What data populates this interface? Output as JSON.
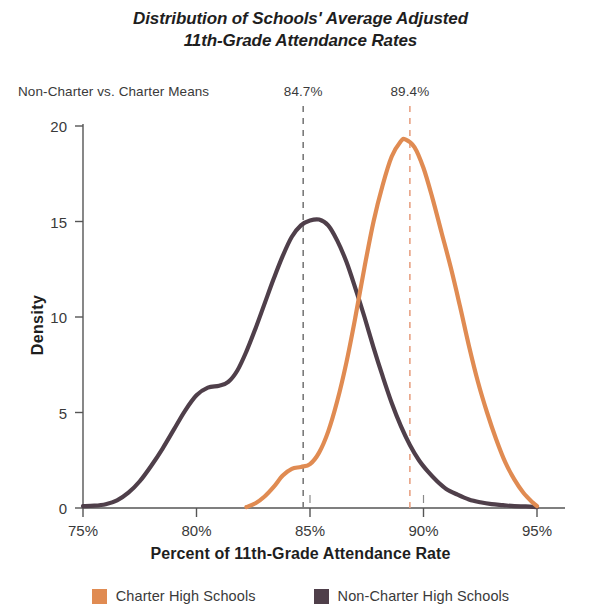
{
  "chart_data": {
    "type": "line",
    "title": "Distribution of Schools' Average Adjusted 11th-Grade Attendance Rates",
    "title_lines": [
      "Distribution of Schools' Average Adjusted",
      "11th-Grade Attendance Rates"
    ],
    "subtitle": "Non-Charter vs. Charter Means",
    "xlabel": "Percent of 11th-Grade Attendance Rate",
    "ylabel": "Density",
    "xlim": [
      75,
      95
    ],
    "ylim": [
      0,
      20
    ],
    "xticks": [
      75,
      80,
      85,
      90,
      95
    ],
    "xticklabels": [
      "75%",
      "80%",
      "85%",
      "90%",
      "95%"
    ],
    "yticks": [
      0,
      5,
      10,
      15,
      20
    ],
    "yticklabels": [
      "0",
      "5",
      "10",
      "15",
      "20"
    ],
    "grid": false,
    "legend_position": "bottom",
    "colors": {
      "charter": "#E08B52",
      "non_charter": "#4F3F4A",
      "axis": "#555555",
      "text": "#3a3a3a",
      "background": "#ffffff"
    },
    "annotations": [
      {
        "name": "non-charter-mean",
        "label": "84.7%",
        "x": 84.7,
        "line_style": "dashed",
        "color": "#7a7a7a"
      },
      {
        "name": "charter-mean",
        "label": "89.4%",
        "x": 89.4,
        "line_style": "dashed",
        "color": "#E8A183"
      }
    ],
    "series": [
      {
        "name": "Charter High Schools",
        "color": "#E08B52",
        "peak_x": 89.1,
        "peak_y": 19.3,
        "mean": 89.4,
        "points": [
          [
            82.2,
            0.05
          ],
          [
            82.6,
            0.25
          ],
          [
            83.0,
            0.6
          ],
          [
            83.4,
            1.1
          ],
          [
            83.8,
            1.7
          ],
          [
            84.2,
            2.05
          ],
          [
            84.6,
            2.15
          ],
          [
            85.0,
            2.3
          ],
          [
            85.4,
            2.9
          ],
          [
            85.8,
            4.0
          ],
          [
            86.2,
            5.6
          ],
          [
            86.6,
            7.6
          ],
          [
            87.0,
            10.0
          ],
          [
            87.4,
            12.6
          ],
          [
            87.8,
            15.0
          ],
          [
            88.2,
            16.9
          ],
          [
            88.6,
            18.4
          ],
          [
            89.0,
            19.2
          ],
          [
            89.2,
            19.3
          ],
          [
            89.6,
            18.9
          ],
          [
            90.0,
            17.8
          ],
          [
            90.4,
            16.2
          ],
          [
            90.8,
            14.4
          ],
          [
            91.2,
            12.6
          ],
          [
            91.6,
            10.6
          ],
          [
            92.0,
            8.5
          ],
          [
            92.4,
            6.6
          ],
          [
            92.8,
            5.0
          ],
          [
            93.2,
            3.6
          ],
          [
            93.6,
            2.4
          ],
          [
            94.0,
            1.5
          ],
          [
            94.4,
            0.8
          ],
          [
            94.8,
            0.3
          ],
          [
            95.0,
            0.1
          ]
        ]
      },
      {
        "name": "Non-Charter High Schools",
        "color": "#4F3F4A",
        "peak_x": 85.4,
        "peak_y": 15.1,
        "mean": 84.7,
        "points": [
          [
            75.0,
            0.1
          ],
          [
            75.5,
            0.12
          ],
          [
            76.0,
            0.2
          ],
          [
            76.5,
            0.4
          ],
          [
            77.0,
            0.8
          ],
          [
            77.5,
            1.4
          ],
          [
            78.0,
            2.2
          ],
          [
            78.5,
            3.1
          ],
          [
            79.0,
            4.1
          ],
          [
            79.5,
            5.1
          ],
          [
            80.0,
            5.9
          ],
          [
            80.5,
            6.3
          ],
          [
            81.0,
            6.4
          ],
          [
            81.4,
            6.6
          ],
          [
            81.8,
            7.2
          ],
          [
            82.2,
            8.2
          ],
          [
            82.6,
            9.4
          ],
          [
            83.0,
            10.7
          ],
          [
            83.4,
            12.0
          ],
          [
            83.8,
            13.2
          ],
          [
            84.2,
            14.2
          ],
          [
            84.6,
            14.8
          ],
          [
            85.0,
            15.05
          ],
          [
            85.4,
            15.1
          ],
          [
            85.8,
            14.8
          ],
          [
            86.2,
            14.0
          ],
          [
            86.6,
            12.9
          ],
          [
            87.0,
            11.5
          ],
          [
            87.4,
            10.0
          ],
          [
            87.8,
            8.4
          ],
          [
            88.2,
            6.9
          ],
          [
            88.6,
            5.5
          ],
          [
            89.0,
            4.3
          ],
          [
            89.4,
            3.3
          ],
          [
            89.8,
            2.5
          ],
          [
            90.2,
            1.9
          ],
          [
            90.6,
            1.4
          ],
          [
            91.0,
            1.0
          ],
          [
            91.5,
            0.7
          ],
          [
            92.0,
            0.45
          ],
          [
            92.5,
            0.3
          ],
          [
            93.0,
            0.2
          ],
          [
            93.5,
            0.15
          ],
          [
            94.0,
            0.1
          ],
          [
            94.5,
            0.08
          ],
          [
            95.0,
            0.05
          ]
        ]
      }
    ],
    "legend": [
      {
        "label": "Charter High Schools",
        "color": "#E08B52"
      },
      {
        "label": "Non-Charter High Schools",
        "color": "#4F3F4A"
      }
    ]
  }
}
